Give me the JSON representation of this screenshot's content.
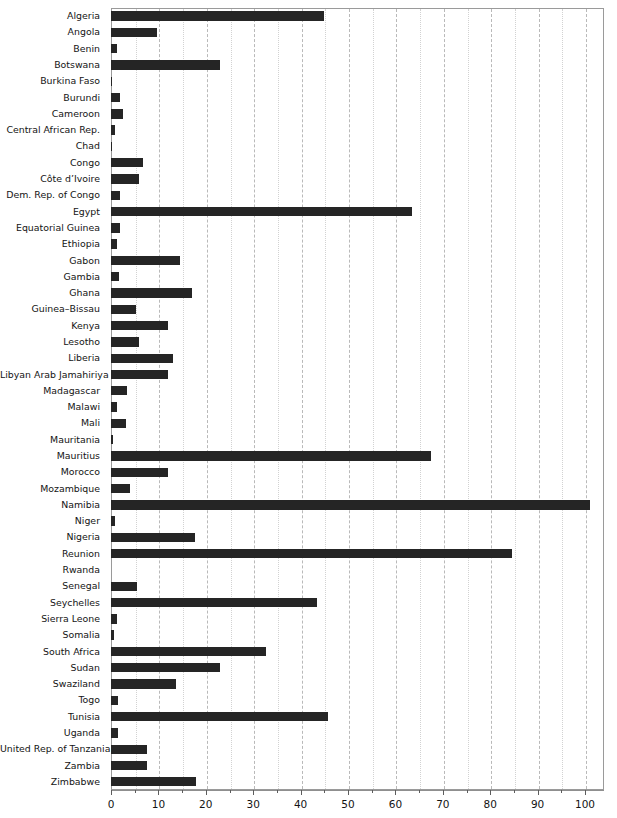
{
  "figure": {
    "top_cropped_text": "",
    "background_color": "#ffffff",
    "bar_color": "#252525",
    "grid_color": "#b9b9b9",
    "frame_color": "#9a9a9a"
  },
  "axis": {
    "x_ticks": [
      0,
      10,
      20,
      30,
      40,
      50,
      60,
      70,
      80,
      90,
      100
    ],
    "x_tick_labels": [
      "0",
      "10",
      "20",
      "30",
      "40",
      "50",
      "60",
      "70",
      "80",
      "90",
      "100"
    ],
    "x_minor_ticks": [
      5,
      15,
      25,
      35,
      45,
      55,
      65,
      75,
      85,
      95,
      105
    ],
    "x_min": 0,
    "x_max": 104,
    "x_axis_title": ""
  },
  "chart_data": {
    "type": "bar",
    "orientation": "horizontal",
    "title": "",
    "subtitle": "",
    "xlabel": "",
    "ylabel": "",
    "xlim": [
      0,
      104
    ],
    "grid": true,
    "legend": "none",
    "categories": [
      "Algeria",
      "Angola",
      "Benin",
      "Botswana",
      "Burkina Faso",
      "Burundi",
      "Cameroon",
      "Central African Rep.",
      "Chad",
      "Congo",
      "Côte d’Ivoire",
      "Dem. Rep. of Congo",
      "Egypt",
      "Equatorial Guinea",
      "Ethiopia",
      "Gabon",
      "Gambia",
      "Ghana",
      "Guinea–Bissau",
      "Kenya",
      "Lesotho",
      "Liberia",
      "Libyan Arab Jamahiriya",
      "Madagascar",
      "Malawi",
      "Mali",
      "Mauritania",
      "Mauritius",
      "Morocco",
      "Mozambique",
      "Namibia",
      "Niger",
      "Nigeria",
      "Reunion",
      "Rwanda",
      "Senegal",
      "Seychelles",
      "Sierra Leone",
      "Somalia",
      "South Africa",
      "Sudan",
      "Swaziland",
      "Togo",
      "Tunisia",
      "Uganda",
      "United Rep. of Tanzania",
      "Zambia",
      "Zimbabwe"
    ],
    "values": [
      45.0,
      9.7,
      1.2,
      23.0,
      0.3,
      1.8,
      2.5,
      0.8,
      0.3,
      6.8,
      6.0,
      1.8,
      63.5,
      1.9,
      1.2,
      14.5,
      1.6,
      17.0,
      5.2,
      12.0,
      6.0,
      13.0,
      12.0,
      3.3,
      1.2,
      3.2,
      0.4,
      67.5,
      12.0,
      4.0,
      101.0,
      0.8,
      17.8,
      84.5,
      0.0,
      5.5,
      43.5,
      1.3,
      0.7,
      32.7,
      23.0,
      13.8,
      1.4,
      45.8,
      1.5,
      7.5,
      7.5,
      18.0
    ]
  }
}
